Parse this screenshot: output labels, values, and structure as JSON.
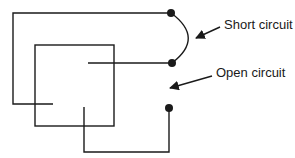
{
  "diagram": {
    "labels": {
      "short_circuit": "Short circuit",
      "open_circuit": "Open circuit"
    },
    "colors": {
      "line": "#1a1a1a",
      "background": "#ffffff"
    }
  }
}
